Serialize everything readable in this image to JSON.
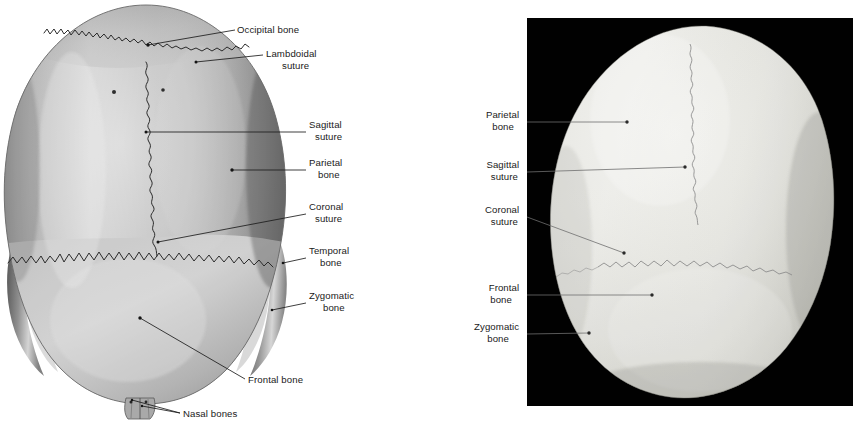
{
  "figure": {
    "kind": "anatomy-plate",
    "view": "superior view of the skull",
    "panels": [
      {
        "id": "left-panel",
        "type": "illustration",
        "medium": "grayscale drawing on white background",
        "background_color": "#ffffff",
        "bone_color": "#b9b9b9",
        "labels": [
          {
            "key": "occipital-bone",
            "text": "Occipital bone",
            "lines": [
              "Occipital bone"
            ],
            "align": "start",
            "x": 237,
            "y": 33,
            "leader": {
              "from": [
                235,
                30
              ],
              "to": [
                148,
                45
              ],
              "dot": [
                148,
                45
              ]
            }
          },
          {
            "key": "lambdoidal-suture",
            "text": "Lambdoidal suture",
            "lines": [
              "Lambdoidal",
              "suture"
            ],
            "align": "start",
            "x": 266,
            "y": 57,
            "leader": {
              "from": [
                263,
                55
              ],
              "to": [
                196,
                62
              ],
              "dot": [
                196,
                62
              ]
            }
          },
          {
            "key": "sagittal-suture",
            "text": "Sagittal suture",
            "lines": [
              "Sagittal",
              "suture"
            ],
            "align": "start",
            "x": 309,
            "y": 128,
            "leader": {
              "from": [
                306,
                132
              ],
              "to": [
                146,
                132
              ],
              "dot": [
                146,
                132
              ]
            }
          },
          {
            "key": "parietal-bone",
            "text": "Parietal bone",
            "lines": [
              "Parietal",
              "bone"
            ],
            "align": "start",
            "x": 309,
            "y": 166,
            "leader": {
              "from": [
                306,
                170
              ],
              "to": [
                232,
                170
              ],
              "dot": [
                232,
                170
              ]
            }
          },
          {
            "key": "coronal-suture",
            "text": "Coronal suture",
            "lines": [
              "Coronal",
              "suture"
            ],
            "align": "start",
            "x": 309,
            "y": 210,
            "leader": {
              "from": [
                306,
                214
              ],
              "to": [
                158,
                242
              ],
              "dot": [
                158,
                242
              ]
            }
          },
          {
            "key": "temporal-bone",
            "text": "Temporal bone",
            "lines": [
              "Temporal",
              "bone"
            ],
            "align": "start",
            "x": 309,
            "y": 254,
            "leader": {
              "from": [
                306,
                258
              ],
              "to": [
                283,
                263
              ],
              "dot": [
                283,
                263
              ]
            }
          },
          {
            "key": "zygomatic-bone",
            "text": "Zygomatic bone",
            "lines": [
              "Zygomatic",
              "bone"
            ],
            "align": "start",
            "x": 309,
            "y": 299,
            "leader": {
              "from": [
                306,
                303
              ],
              "to": [
                272,
                310
              ],
              "dot": [
                272,
                310
              ]
            }
          },
          {
            "key": "frontal-bone",
            "text": "Frontal bone",
            "lines": [
              "Frontal bone"
            ],
            "align": "start",
            "x": 248,
            "y": 383,
            "leader": {
              "from": [
                245,
                379
              ],
              "to": [
                140,
                318
              ],
              "dot": [
                140,
                318
              ]
            }
          },
          {
            "key": "nasal-bones",
            "text": "Nasal bones",
            "lines": [
              "Nasal bones"
            ],
            "align": "start",
            "x": 183,
            "y": 417,
            "leader": {
              "from": [
                180,
                413
              ],
              "to": [
                132,
                400
              ],
              "dot": [
                132,
                400
              ]
            }
          }
        ]
      },
      {
        "id": "right-panel",
        "type": "photograph",
        "medium": "black-and-white photograph on black background",
        "background_color": "#010101",
        "bone_color": "#e9e9e5",
        "frame": {
          "x": 527,
          "y": 18,
          "width": 326,
          "height": 388
        },
        "labels": [
          {
            "key": "parietal-bone",
            "text": "Parietal bone",
            "lines": [
              "Parietal",
              "bone"
            ],
            "align": "end",
            "x": 522,
            "y": 118,
            "leader": {
              "from": [
                527,
                122
              ],
              "to": [
                627,
                122
              ],
              "dot": [
                627,
                122
              ]
            }
          },
          {
            "key": "sagittal-suture",
            "text": "Sagittal suture",
            "lines": [
              "Sagittal",
              "suture"
            ],
            "align": "end",
            "x": 522,
            "y": 168,
            "leader": {
              "from": [
                527,
                172
              ],
              "to": [
                685,
                167
              ],
              "dot": [
                685,
                167
              ]
            }
          },
          {
            "key": "coronal-suture",
            "text": "Coronal suture",
            "lines": [
              "Coronal",
              "suture"
            ],
            "align": "end",
            "x": 522,
            "y": 213,
            "leader": {
              "from": [
                527,
                217
              ],
              "to": [
                624,
                253
              ],
              "dot": [
                624,
                253
              ]
            }
          },
          {
            "key": "frontal-bone",
            "text": "Frontal bone",
            "lines": [
              "Frontal",
              "bone"
            ],
            "align": "end",
            "x": 522,
            "y": 291,
            "leader": {
              "from": [
                527,
                295
              ],
              "to": [
                652,
                295
              ],
              "dot": [
                652,
                295
              ]
            }
          },
          {
            "key": "zygomatic-bone",
            "text": "Zygomatic bone",
            "lines": [
              "Zygomatic",
              "bone"
            ],
            "align": "end",
            "x": 522,
            "y": 330,
            "leader": {
              "from": [
                527,
                334
              ],
              "to": [
                589,
                333
              ],
              "dot": [
                589,
                333
              ]
            }
          }
        ]
      }
    ],
    "structures_named": [
      "Occipital bone",
      "Lambdoidal suture",
      "Sagittal suture",
      "Parietal bone",
      "Coronal suture",
      "Temporal bone",
      "Zygomatic bone",
      "Frontal bone",
      "Nasal bones"
    ]
  }
}
